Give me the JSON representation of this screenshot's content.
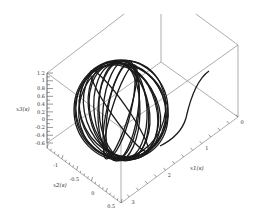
{
  "chart_data": {
    "type": "line3d",
    "title": "",
    "axes": {
      "x1": {
        "label": "x1(s)",
        "ticks": [
          "0",
          "1",
          "2",
          "3"
        ],
        "range": [
          0,
          3
        ]
      },
      "x2": {
        "label": "x2(s)",
        "ticks": [
          "-1",
          "-0.5",
          "0",
          "0.5"
        ],
        "range": [
          -1.2,
          0.6
        ]
      },
      "x3": {
        "label": "x3(s)",
        "ticks": [
          "1.2",
          "1",
          "0.8",
          "0.6",
          "0.4",
          "0.2",
          "0",
          "-0.2",
          "-0.4",
          "-0.6"
        ],
        "range": [
          -0.6,
          1.2
        ]
      }
    },
    "series": [
      {
        "name": "trajectory",
        "shape": "sphere-winding",
        "center_px": [
          121,
          110
        ],
        "radius_px": [
          47,
          50
        ],
        "loops": 14
      },
      {
        "name": "tail",
        "shape": "transient curve from x1≈0.3 rising to sphere"
      }
    ],
    "box": true,
    "grid": false
  },
  "labels": {
    "x1": "x1(s)",
    "x2": "x2(s)",
    "x3": "x3(s)",
    "x1_ticks": [
      "0",
      "1",
      "2",
      "3"
    ],
    "x2_ticks": [
      "-1",
      "-0.5",
      "0",
      "0.5"
    ],
    "x3_ticks": [
      "1.2",
      "1",
      "0.8",
      "0.6",
      "0.4",
      "0.2",
      "0",
      "-0.2",
      "-0.4",
      "-0.6"
    ]
  }
}
